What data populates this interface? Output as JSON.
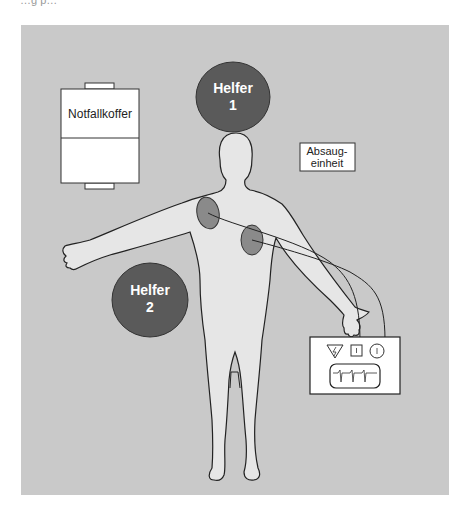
{
  "figure": {
    "top_cut_text": "…g p…",
    "background_color": "#c9c9c9",
    "body_fill": "#e6e6e6",
    "helper_circle_color": "#5a5a5a",
    "electrode_color": "#8a8a8a"
  },
  "labels": {
    "emergency_case": "Notfallkoffer",
    "suction_unit_line1": "Absaug-",
    "suction_unit_line2": "einheit",
    "helper1_line1": "Helfer",
    "helper1_line2": "1",
    "helper2_line1": "Helfer",
    "helper2_line2": "2"
  },
  "defibrillator": {
    "buttons": [
      {
        "shape": "triangle",
        "symbol": "⚡"
      },
      {
        "shape": "square",
        "symbol": "ı"
      },
      {
        "shape": "circle",
        "symbol": "ı"
      }
    ],
    "screen": "ecg-trace"
  }
}
